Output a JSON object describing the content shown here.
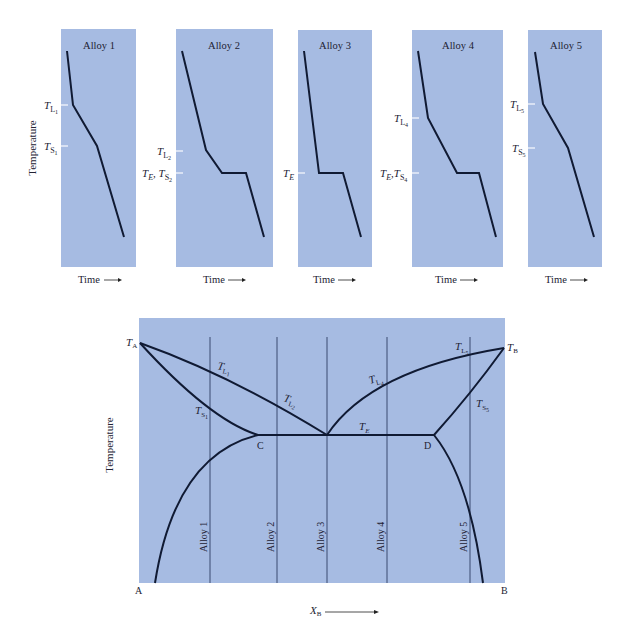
{
  "colors": {
    "panel_bg": "#a6bbe2",
    "curve": "#101a33",
    "tick": "#e8eef9",
    "alloy_line": "#3a4a70"
  },
  "cooling_curves": {
    "y_axis_label": "Temperature",
    "x_axis_label": "Time",
    "panels": [
      {
        "title": "Alloy 1",
        "labels": [
          {
            "main": "T",
            "sub": "L",
            "subsub": "1"
          },
          {
            "main": "T",
            "sub": "S",
            "subsub": "1"
          }
        ]
      },
      {
        "title": "Alloy 2",
        "labels": [
          {
            "main": "T",
            "sub": "L",
            "subsub": "2"
          },
          {
            "main": "T_E, T",
            "sub": "S",
            "subsub": "2"
          }
        ]
      },
      {
        "title": "Alloy 3",
        "labels": [
          {
            "main": "T",
            "sub": "E",
            "subsub": ""
          }
        ]
      },
      {
        "title": "Alloy 4",
        "labels": [
          {
            "main": "T",
            "sub": "L",
            "subsub": "4"
          },
          {
            "main": "T_E, T",
            "sub": "S",
            "subsub": "4"
          }
        ]
      },
      {
        "title": "Alloy 5",
        "labels": [
          {
            "main": "T",
            "sub": "L",
            "subsub": "5"
          },
          {
            "main": "T",
            "sub": "S",
            "subsub": "5"
          }
        ]
      }
    ]
  },
  "phase_diagram": {
    "y_axis_label": "Temperature",
    "x_axis_label": "X",
    "x_axis_sub": "B",
    "corner_left": "A",
    "corner_right": "B",
    "point_TA": "T",
    "point_TA_sub": "A",
    "point_TB": "T",
    "point_TB_sub": "B",
    "point_C": "C",
    "point_D": "D",
    "eutectic_label": "T",
    "eutectic_sub": "E",
    "curve_labels": [
      {
        "main": "T",
        "sub": "L",
        "subsub": "1"
      },
      {
        "main": "T",
        "sub": "L",
        "subsub": "2"
      },
      {
        "main": "T",
        "sub": "S",
        "subsub": "1"
      },
      {
        "main": "T",
        "sub": "L",
        "subsub": "4"
      },
      {
        "main": "T",
        "sub": "L",
        "subsub": "5"
      },
      {
        "main": "T",
        "sub": "S",
        "subsub": "5"
      }
    ],
    "alloy_lines": [
      "Alloy 1",
      "Alloy 2",
      "Alloy 3",
      "Alloy 4",
      "Alloy 5"
    ]
  }
}
